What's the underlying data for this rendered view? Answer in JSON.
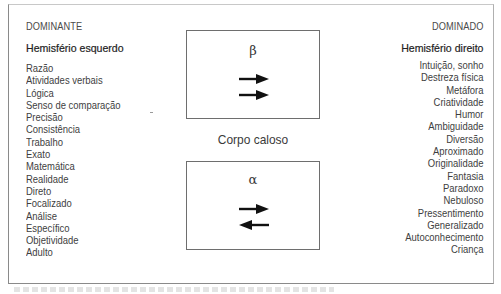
{
  "left": {
    "category": "DOMINANTE",
    "heading": "Hemisfério esquerdo",
    "items": [
      "Razão",
      "Atividades verbais",
      "Lógica",
      "Senso de comparação",
      "Precisão",
      "Consistência",
      "Trabalho",
      "Exato",
      "Matemática",
      "Realidade",
      "Direto",
      "Focalizado",
      "Análise",
      "Específico",
      "Objetividade",
      "Adulto"
    ]
  },
  "right": {
    "category": "DOMINADO",
    "heading": "Hemisfério direito",
    "items": [
      "Intuição, sonho",
      "Destreza física",
      "Metáfora",
      "Criatividade",
      "Humor",
      "Ambiguidade",
      "Diversão",
      "Aproximado",
      "Originalidade",
      "Fantasia",
      "Paradoxo",
      "Nebuloso",
      "Pressentimento",
      "Generalizado",
      "Autoconhecimento",
      "Criança"
    ]
  },
  "center": {
    "top_box": {
      "symbol": "β",
      "arrows": [
        "right",
        "right"
      ]
    },
    "label": "Corpo caloso",
    "bottom_box": {
      "symbol": "α",
      "arrows": [
        "right",
        "left"
      ]
    }
  },
  "colors": {
    "border": "#8a8a8a",
    "text": "#3a3a3a",
    "arrow": "#111111"
  }
}
